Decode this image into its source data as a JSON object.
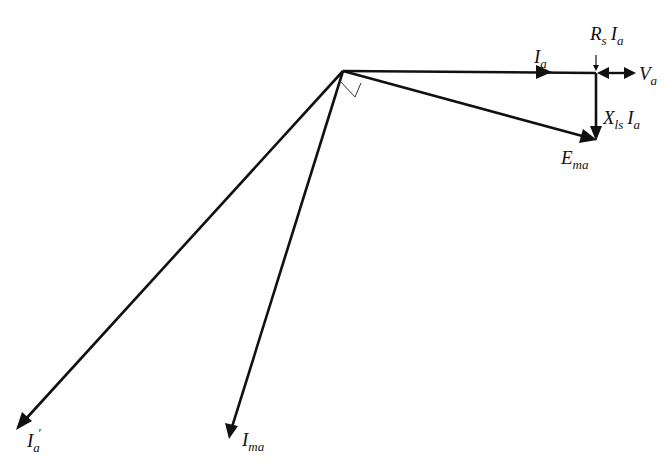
{
  "diagram": {
    "type": "phasor-diagram",
    "origin": {
      "x": 343,
      "y": 71
    },
    "stroke_color": "#111111",
    "background": "#ffffff",
    "phasors": [
      {
        "id": "Ia",
        "label_main": "I",
        "label_sub": "a",
        "from": [
          343,
          71
        ],
        "to": [
          580,
          73
        ],
        "arrow_at": "mid"
      },
      {
        "id": "Ema",
        "label_main": "E",
        "label_sub": "ma",
        "from": [
          343,
          71
        ],
        "to": [
          596,
          140
        ],
        "arrow_at": "end"
      },
      {
        "id": "XlsIa",
        "label_main": "X",
        "label_sub": "ls",
        "label_tail_main": "I",
        "label_tail_sub": "a",
        "from": [
          596,
          73
        ],
        "to": [
          596,
          140
        ],
        "arrow_at": "end"
      },
      {
        "id": "RsIa",
        "label_main": "R",
        "label_sub": "s",
        "label_tail_main": "I",
        "label_tail_sub": "a",
        "from": [
          596,
          73
        ],
        "to": [
          618,
          73
        ]
      },
      {
        "id": "Va",
        "label_main": "V",
        "label_sub": "a",
        "from": [
          596,
          73
        ],
        "to": [
          636,
          73
        ]
      },
      {
        "id": "Ia_prime",
        "label_main": "I",
        "label_sub": "a",
        "label_prime": "′",
        "from": [
          343,
          71
        ],
        "to": [
          16,
          430
        ],
        "arrow_at": "end"
      },
      {
        "id": "Ima",
        "label_main": "I",
        "label_sub": "ma",
        "from": [
          343,
          71
        ],
        "to": [
          229,
          439
        ],
        "arrow_at": "end"
      }
    ],
    "right_angle_marker": {
      "between": [
        "Ema",
        "Ima"
      ]
    }
  },
  "labels": {
    "Ia": {
      "main": "I",
      "sub": "a"
    },
    "Ema": {
      "main": "E",
      "sub": "ma"
    },
    "XlsIa": {
      "main": "X",
      "sub": "ls",
      "main2": "I",
      "sub2": "a"
    },
    "RsIa": {
      "main": "R",
      "sub": "s",
      "main2": "I",
      "sub2": "a"
    },
    "Va": {
      "main": "V",
      "sub": "a"
    },
    "Ia_prime": {
      "main": "I",
      "sub": "a",
      "prime": "′"
    },
    "Ima": {
      "main": "I",
      "sub": "ma"
    }
  }
}
